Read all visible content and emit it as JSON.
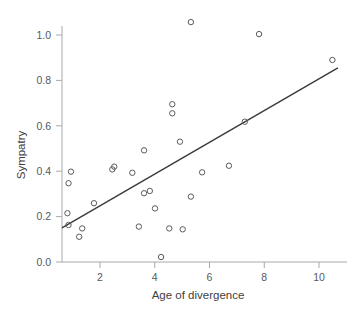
{
  "chart_data": {
    "type": "scatter",
    "title": "",
    "subtitle": "",
    "xlabel": "Age of divergence",
    "ylabel": "Sympatry",
    "xlim": [
      0.45,
      11.05
    ],
    "ylim": [
      -0.04,
      1.1
    ],
    "xticks": [
      2,
      4,
      6,
      8,
      10
    ],
    "xtick_labels": [
      "2",
      "4",
      "6",
      "8",
      "10"
    ],
    "yticks": [
      0.0,
      0.2,
      0.4,
      0.6,
      0.8,
      1.0
    ],
    "ytick_labels": [
      "0.0",
      "0.2",
      "0.4",
      "0.6",
      "0.8",
      "1.0"
    ],
    "grid": false,
    "legend": null,
    "marker": "open-circle",
    "marker_color": "#5b5b5f",
    "points": [
      {
        "x": 0.81,
        "y": 0.215
      },
      {
        "x": 0.85,
        "y": 0.163
      },
      {
        "x": 0.85,
        "y": 0.347
      },
      {
        "x": 0.94,
        "y": 0.398
      },
      {
        "x": 1.24,
        "y": 0.111
      },
      {
        "x": 1.35,
        "y": 0.148
      },
      {
        "x": 1.78,
        "y": 0.259
      },
      {
        "x": 2.45,
        "y": 0.408
      },
      {
        "x": 2.52,
        "y": 0.42
      },
      {
        "x": 3.18,
        "y": 0.393
      },
      {
        "x": 3.42,
        "y": 0.156
      },
      {
        "x": 3.61,
        "y": 0.303
      },
      {
        "x": 3.61,
        "y": 0.492
      },
      {
        "x": 3.82,
        "y": 0.313
      },
      {
        "x": 4.01,
        "y": 0.236
      },
      {
        "x": 4.23,
        "y": 0.022
      },
      {
        "x": 4.53,
        "y": 0.148
      },
      {
        "x": 4.64,
        "y": 0.655
      },
      {
        "x": 4.64,
        "y": 0.695
      },
      {
        "x": 4.92,
        "y": 0.53
      },
      {
        "x": 5.02,
        "y": 0.144
      },
      {
        "x": 5.32,
        "y": 1.057
      },
      {
        "x": 5.32,
        "y": 0.288
      },
      {
        "x": 5.73,
        "y": 0.395
      },
      {
        "x": 6.71,
        "y": 0.424
      },
      {
        "x": 7.29,
        "y": 0.618
      },
      {
        "x": 7.81,
        "y": 1.004
      },
      {
        "x": 10.49,
        "y": 0.89
      }
    ],
    "fit_line": {
      "type": "linear-regression",
      "x_start": 0.61,
      "y_start": 0.15,
      "x_end": 10.69,
      "y_end": 0.855,
      "slope": 0.07,
      "intercept": 0.107,
      "color": "#3a3a3c"
    }
  }
}
